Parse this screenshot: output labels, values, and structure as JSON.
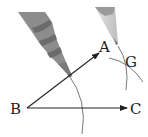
{
  "diagram": {
    "type": "geometry-construction",
    "points": {
      "A": {
        "label": "A"
      },
      "B": {
        "label": "B"
      },
      "C": {
        "label": "C"
      },
      "G": {
        "label": "G"
      }
    },
    "rays": [
      {
        "from": "B",
        "to": "A",
        "label": "ray BA"
      },
      {
        "from": "B",
        "to": "C",
        "label": "ray BC"
      }
    ],
    "colors": {
      "line": "#222222",
      "arc": "#555555",
      "pencil_dark": "#8a8a8a",
      "pencil_band": "#6e6e6e",
      "pencil_light": "#c8c8c8"
    }
  }
}
